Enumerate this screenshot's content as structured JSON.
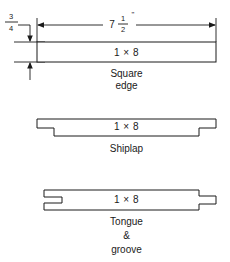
{
  "figure": {
    "line_color": "#1a1a1a",
    "background_color": "#ffffff"
  },
  "dimensions": {
    "thickness": {
      "label": "3/4",
      "numerator": "3",
      "denominator": "4",
      "orientation": "vertical"
    },
    "width": {
      "label": "7 1/2\"",
      "whole": "7",
      "numerator": "1",
      "denominator": "2",
      "unit_mark": "\"",
      "orientation": "horizontal"
    }
  },
  "profiles": [
    {
      "id": "square-edge",
      "board_label": "1 × 8",
      "caption_lines": [
        "Square",
        "edge"
      ],
      "caption": "Square edge"
    },
    {
      "id": "shiplap",
      "board_label": "1 × 8",
      "caption_lines": [
        "Shiplap"
      ],
      "caption": "Shiplap"
    },
    {
      "id": "tongue-and-groove",
      "board_label": "1 × 8",
      "caption_lines": [
        "Tongue",
        "&",
        "groove"
      ],
      "caption": "Tongue & groove"
    }
  ]
}
